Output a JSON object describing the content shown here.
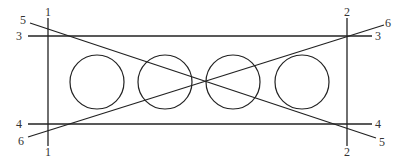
{
  "diagram": {
    "lines": [
      {
        "id": "1",
        "type": "vertical",
        "x1": 48,
        "y1": 18,
        "x2": 48,
        "y2": 146,
        "labels": [
          {
            "text": "1",
            "x": 48,
            "y": 16,
            "anchor": "middle"
          },
          {
            "text": "1",
            "x": 48,
            "y": 156,
            "anchor": "middle"
          }
        ]
      },
      {
        "id": "2",
        "type": "vertical",
        "x1": 347,
        "y1": 18,
        "x2": 347,
        "y2": 146,
        "labels": [
          {
            "text": "2",
            "x": 347,
            "y": 16,
            "anchor": "middle"
          },
          {
            "text": "2",
            "x": 347,
            "y": 156,
            "anchor": "middle"
          }
        ]
      },
      {
        "id": "3",
        "type": "horizontal",
        "x1": 28,
        "y1": 36,
        "x2": 372,
        "y2": 36,
        "labels": [
          {
            "text": "3",
            "x": 22,
            "y": 40,
            "anchor": "end"
          },
          {
            "text": "3",
            "x": 375,
            "y": 40,
            "anchor": "start"
          }
        ]
      },
      {
        "id": "4",
        "type": "horizontal",
        "x1": 28,
        "y1": 124,
        "x2": 372,
        "y2": 124,
        "labels": [
          {
            "text": "4",
            "x": 22,
            "y": 128,
            "anchor": "end"
          },
          {
            "text": "4",
            "x": 375,
            "y": 128,
            "anchor": "start"
          }
        ]
      },
      {
        "id": "5",
        "type": "diagonal",
        "x1": 30,
        "y1": 23,
        "x2": 376,
        "y2": 138,
        "labels": [
          {
            "text": "5",
            "x": 26,
            "y": 24,
            "anchor": "end"
          },
          {
            "text": "5",
            "x": 379,
            "y": 146,
            "anchor": "start"
          }
        ]
      },
      {
        "id": "6",
        "type": "diagonal",
        "x1": 28,
        "y1": 137,
        "x2": 384,
        "y2": 25,
        "labels": [
          {
            "text": "6",
            "x": 24,
            "y": 145,
            "anchor": "end"
          },
          {
            "text": "6",
            "x": 385,
            "y": 27,
            "anchor": "start"
          }
        ]
      }
    ],
    "circles": [
      {
        "cx": 97,
        "cy": 82,
        "r": 27
      },
      {
        "cx": 165,
        "cy": 82,
        "r": 27
      },
      {
        "cx": 233,
        "cy": 82,
        "r": 27
      },
      {
        "cx": 302,
        "cy": 82,
        "r": 27
      }
    ],
    "colors": {
      "stroke": "#222222",
      "label": "#333333",
      "background": "#ffffff"
    }
  }
}
